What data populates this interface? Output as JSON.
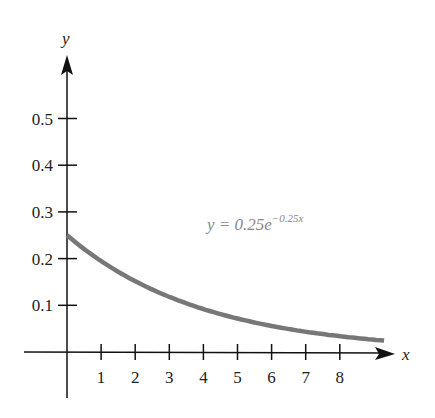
{
  "chart_data": {
    "type": "line",
    "title": "",
    "xlabel": "x",
    "ylabel": "y",
    "x_ticks": [
      "1",
      "2",
      "3",
      "4",
      "5",
      "6",
      "7",
      "8"
    ],
    "y_ticks": [
      "0.1",
      "0.2",
      "0.3",
      "0.4",
      "0.5"
    ],
    "xlim": [
      0,
      9.3
    ],
    "ylim": [
      0,
      0.55
    ],
    "grid": false,
    "annotation": {
      "text_prefix": "y = 0.25e",
      "exponent": "−0.25x",
      "x": 4,
      "y": 0.27
    },
    "series": [
      {
        "name": "y = 0.25e^(-0.25x)",
        "color": "#777777",
        "x": [
          0,
          1,
          2,
          3,
          4,
          5,
          6,
          7,
          8,
          9.3
        ],
        "y": [
          0.25,
          0.195,
          0.152,
          0.118,
          0.092,
          0.072,
          0.056,
          0.043,
          0.034,
          0.024
        ]
      }
    ]
  }
}
